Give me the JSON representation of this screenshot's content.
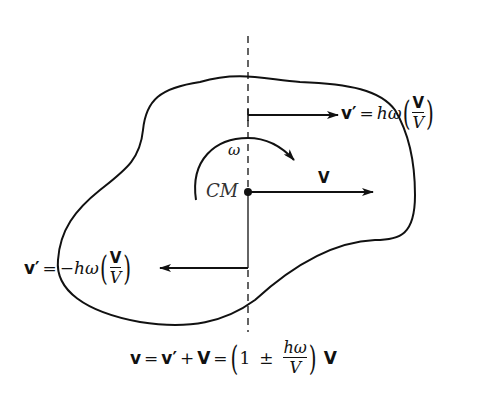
{
  "diagram": {
    "title": "",
    "labels": {
      "cm": "CM",
      "omega": "ω",
      "V": "V",
      "top_equation": {
        "lhs": "v′",
        "equals": "=",
        "coef": "hω",
        "frac_num": "V",
        "frac_den": "V"
      },
      "left_equation": {
        "lhs": "v′",
        "equals": "=",
        "coef": "−hω",
        "frac_num": "V",
        "frac_den": "V"
      },
      "bottom_equation": {
        "v": "v",
        "eq1": "=",
        "vprime": "v′",
        "plus": "+",
        "V1": "V",
        "eq2": "=",
        "one": "1",
        "pm": "±",
        "frac_num": "hω",
        "frac_den": "V",
        "V2": "V"
      }
    },
    "elements": [
      {
        "type": "closed-curve",
        "role": "rigid body outline"
      },
      {
        "type": "axis-line",
        "role": "vertical line through CM, dashed outside body"
      },
      {
        "type": "arrow",
        "role": "velocity v′ at top, pointing right"
      },
      {
        "type": "arrow",
        "role": "velocity V of CM, pointing right"
      },
      {
        "type": "arrow",
        "role": "velocity v′ at bottom, pointing left"
      },
      {
        "type": "curved-arrow",
        "role": "angular velocity ω, clockwise"
      },
      {
        "type": "point",
        "role": "center of mass CM"
      }
    ],
    "colors": {
      "ink": "#111111",
      "background": "#ffffff"
    }
  }
}
